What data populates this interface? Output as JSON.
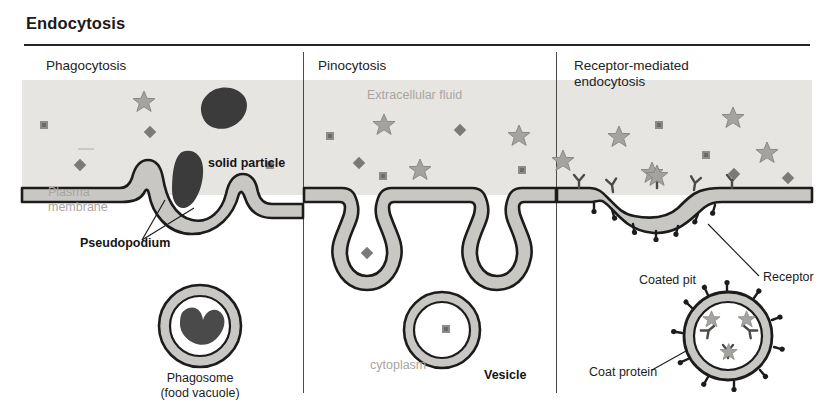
{
  "figure": {
    "title": "Endocytosis"
  },
  "panels": [
    {
      "id": "phagocytosis",
      "title": "Phagocytosis",
      "labels": {
        "solid_particle": "solid particle",
        "plasma_membrane": "Plasma\nmembrane",
        "pseudopodium": "Pseudopodium",
        "phagosome": "Phagosome\n(food vacuole)"
      }
    },
    {
      "id": "pinocytosis",
      "title": "Pinocytosis",
      "labels": {
        "extracellular_fluid": "Extracellular fluid",
        "vesicle": "Vesicle",
        "cytoplasm": "cytoplasm"
      }
    },
    {
      "id": "receptor-mediated-endocytosis",
      "title": "Receptor-mediated\nendocytosis",
      "labels": {
        "coated_pit": "Coated pit",
        "receptor": "Receptor",
        "coat_protein": "Coat protein",
        "coated_vesicle": "Coated vesicle"
      }
    }
  ],
  "colors": {
    "extracellular_fluid": "#e7e5e2",
    "cytoplasm": "#ffffff",
    "membrane_fill": "#c9c7c4",
    "membrane_outline": "#1a1a1a",
    "solute_gray": "#8e8c89",
    "solid_particle": "#3a3a3a",
    "soft_text": "#a9a5a1",
    "hard_text": "#141414",
    "rule": "#262626"
  }
}
